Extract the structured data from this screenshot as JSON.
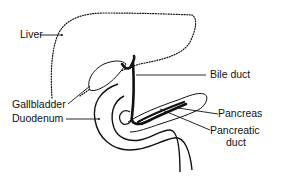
{
  "diagram": {
    "colors": {
      "stroke": "#111111",
      "background": "#ffffff"
    },
    "labels": {
      "liver": "Liver",
      "bile_duct": "Bile duct",
      "gallbladder": "Gallbladder",
      "duodenum": "Duodenum",
      "pancreas": "Pancreas",
      "pancreatic_duct_line1": "Pancreatic",
      "pancreatic_duct_line2": "duct"
    }
  }
}
